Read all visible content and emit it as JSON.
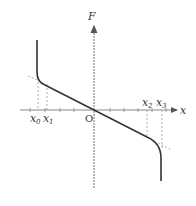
{
  "diagram": {
    "type": "force-displacement graph",
    "axes": {
      "x_label": "x",
      "y_label": "F",
      "origin_label": "O"
    },
    "markers": [
      {
        "name": "x0",
        "base": "x",
        "sub": "0"
      },
      {
        "name": "x1",
        "base": "x",
        "sub": "1"
      },
      {
        "name": "x2",
        "base": "x",
        "sub": "2"
      },
      {
        "name": "x3",
        "base": "x",
        "sub": "3"
      }
    ],
    "curve": {
      "description": "Linear restoring force F through origin with negative slope, becoming vertical (infinite stiffness) beyond x0 on left and x3 on right",
      "color": "#333333"
    },
    "colors": {
      "axis": "#888888",
      "curve": "#333333",
      "dashed": "#999999"
    }
  }
}
